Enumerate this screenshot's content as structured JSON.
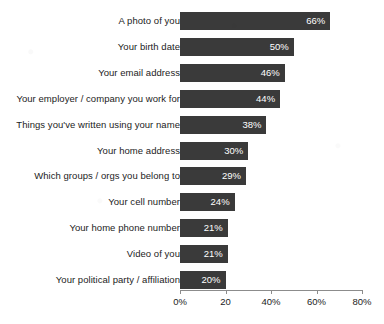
{
  "chart_data": {
    "type": "bar",
    "orientation": "horizontal",
    "title": "",
    "xlabel": "",
    "ylabel": "",
    "xlim": [
      0,
      80
    ],
    "grid": false,
    "legend": null,
    "categories": [
      "A photo of you",
      "Your birth date",
      "Your email address",
      "Your employer / company you work for",
      "Things you've written using your name",
      "Your home address",
      "Which groups / orgs you belong to",
      "Your cell number",
      "Your home phone number",
      "Video of you",
      "Your political party / affiliation"
    ],
    "values": [
      66,
      50,
      46,
      44,
      38,
      30,
      29,
      24,
      21,
      21,
      20
    ],
    "value_labels": [
      "66%",
      "50%",
      "46%",
      "44%",
      "38%",
      "30%",
      "29%",
      "24%",
      "21%",
      "21%",
      "20%"
    ],
    "xticks": [
      0,
      20,
      40,
      60,
      80
    ],
    "xticklabels": [
      "0%",
      "20",
      "40%",
      "60%",
      "80%"
    ],
    "bar_color": "#3a3a3a",
    "value_label_color": "#ffffff",
    "axis_color": "#8c8c8c"
  }
}
